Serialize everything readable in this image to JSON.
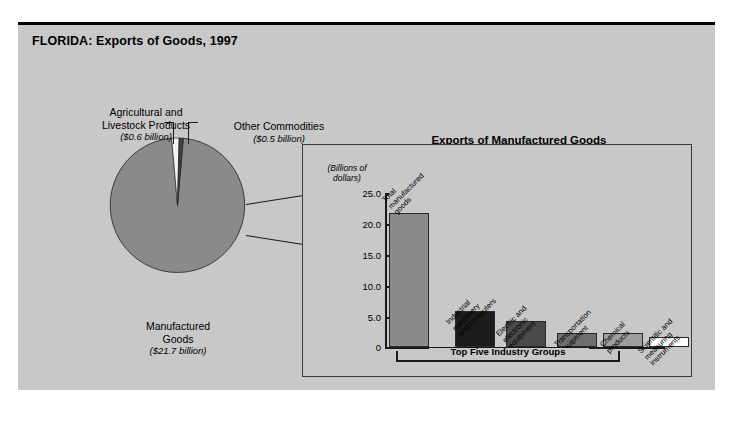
{
  "figure": {
    "title": "FLORIDA: Exports of Goods, 1997",
    "background_color": "#c8c8c8"
  },
  "pie": {
    "labels": {
      "agricultural": {
        "name": "Agricultural and\nLivestock Products",
        "line1": "Agricultural and",
        "line2": "Livestock Products",
        "amount": "($0.6 billion)"
      },
      "other": {
        "line1": "Other Commodities",
        "amount": "($0.5 billion)"
      },
      "manufactured": {
        "line1": "Manufactured",
        "line2": "Goods",
        "amount": "($21.7 billion)"
      }
    }
  },
  "panel": {
    "title": "Exports of Manufactured Goods",
    "yaxis_title_line1": "(Billions of",
    "yaxis_title_line2": "dollars)",
    "bracket_label": "Top Five Industry Groups"
  },
  "chart_data": [
    {
      "type": "pie",
      "title": "FLORIDA: Exports of Goods, 1997",
      "unit": "billions of dollars",
      "labels": [
        "Manufactured Goods",
        "Agricultural and Livestock Products",
        "Other Commodities"
      ],
      "values": [
        21.7,
        0.6,
        0.5
      ],
      "value_labels": [
        "($21.7 billion)",
        "($0.6 billion)",
        "($0.5 billion)"
      ],
      "colors": [
        "#8a8a8a",
        "#f2f2f2",
        "#3f3f3f"
      ],
      "legend": "labels placed outside with leader lines"
    },
    {
      "type": "bar",
      "title": "Exports of Manufactured Goods",
      "ylabel": "(Billions of dollars)",
      "xlabel": "",
      "categories": [
        "Total manufactured goods",
        "Industrial machinery and computers",
        "Electric and electronic equipment",
        "Transportation equipment",
        "Chemical products",
        "Scientific and measuring instruments"
      ],
      "category_lines": [
        [
          "Total",
          "manufactured",
          "goods"
        ],
        [
          "Industrial",
          "machinery",
          "and computers"
        ],
        [
          "Electric and",
          "electronic",
          "equipment"
        ],
        [
          "Transportation",
          "equipment"
        ],
        [
          "Chemical",
          "products"
        ],
        [
          "Scientific and",
          "measuring",
          "instruments"
        ]
      ],
      "values": [
        21.7,
        5.9,
        4.2,
        2.3,
        2.2,
        1.6
      ],
      "colors": [
        "#8a8a8a",
        "#1c1c1c",
        "#4a4a4a",
        "#6e6e6e",
        "#9e9e9e",
        "#ffffff"
      ],
      "ylim": [
        0,
        25
      ],
      "yticks": [
        0,
        5.0,
        10.0,
        15.0,
        20.0,
        25.0
      ],
      "ytick_labels": [
        "0",
        "5.0",
        "10.0",
        "15.0",
        "20.0",
        "25.0"
      ],
      "grid": false,
      "annotation": "Top Five Industry Groups"
    }
  ]
}
